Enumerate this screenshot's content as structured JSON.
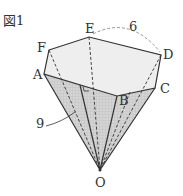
{
  "figure": {
    "title": "図1",
    "vertices": {
      "A": "A",
      "B": "B",
      "C": "C",
      "D": "D",
      "E": "E",
      "F": "F",
      "O": "O"
    },
    "length_top": "6",
    "length_edge": "9"
  },
  "colors": {
    "line": "#333333",
    "top_face": "#eeeeee",
    "side_face": "#c8c8c8"
  }
}
